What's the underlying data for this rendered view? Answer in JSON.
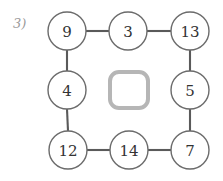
{
  "worksheet": {
    "question_number": "3)",
    "background_color": "#ffffff"
  },
  "puzzle": {
    "type": "number-ring",
    "grid": {
      "rows": 3,
      "cols": 3
    },
    "node_stroke_color": "#6b6b6b",
    "connector_color": "#5a5a5a",
    "empty_slot_color": "#b6b6b6",
    "nodes": [
      {
        "id": "node-top-left",
        "value": "9",
        "position": "top-left",
        "cx": 67,
        "cy": 31,
        "r": 19
      },
      {
        "id": "node-top-center",
        "value": "3",
        "position": "top-center",
        "cx": 128,
        "cy": 31,
        "r": 19
      },
      {
        "id": "node-top-right",
        "value": "13",
        "position": "top-right",
        "cx": 190,
        "cy": 31,
        "r": 19
      },
      {
        "id": "node-middle-left",
        "value": "4",
        "position": "middle-left",
        "cx": 67,
        "cy": 90,
        "r": 19
      },
      {
        "id": "node-middle-right",
        "value": "5",
        "position": "middle-right",
        "cx": 190,
        "cy": 90,
        "r": 19
      },
      {
        "id": "node-bottom-left",
        "value": "12",
        "position": "bottom-left",
        "cx": 68,
        "cy": 150,
        "r": 19
      },
      {
        "id": "node-bottom-center",
        "value": "14",
        "position": "bottom-center",
        "cx": 129,
        "cy": 150,
        "r": 19
      },
      {
        "id": "node-bottom-right",
        "value": "7",
        "position": "bottom-right",
        "cx": 190,
        "cy": 150,
        "r": 19
      }
    ],
    "empty_slot": {
      "id": "center-empty-slot",
      "value": "",
      "position": "center",
      "x": 110,
      "y": 72,
      "width": 38,
      "height": 36,
      "corner_radius": 9
    },
    "connectors": [
      {
        "from": "node-top-left",
        "to": "node-top-center",
        "x1": 86,
        "y1": 31,
        "x2": 109,
        "y2": 31
      },
      {
        "from": "node-top-center",
        "to": "node-top-right",
        "x1": 147,
        "y1": 31,
        "x2": 171,
        "y2": 31
      },
      {
        "from": "node-top-left",
        "to": "node-middle-left",
        "x1": 67,
        "y1": 50,
        "x2": 67,
        "y2": 71
      },
      {
        "from": "node-middle-left",
        "to": "node-bottom-left",
        "x1": 67,
        "y1": 109,
        "x2": 68,
        "y2": 131
      },
      {
        "from": "node-top-right",
        "to": "node-middle-right",
        "x1": 190,
        "y1": 50,
        "x2": 190,
        "y2": 71
      },
      {
        "from": "node-middle-right",
        "to": "node-bottom-right",
        "x1": 190,
        "y1": 109,
        "x2": 190,
        "y2": 131
      },
      {
        "from": "node-bottom-left",
        "to": "node-bottom-center",
        "x1": 87,
        "y1": 150,
        "x2": 110,
        "y2": 150
      },
      {
        "from": "node-bottom-center",
        "to": "node-bottom-right",
        "x1": 148,
        "y1": 150,
        "x2": 171,
        "y2": 150
      }
    ]
  }
}
